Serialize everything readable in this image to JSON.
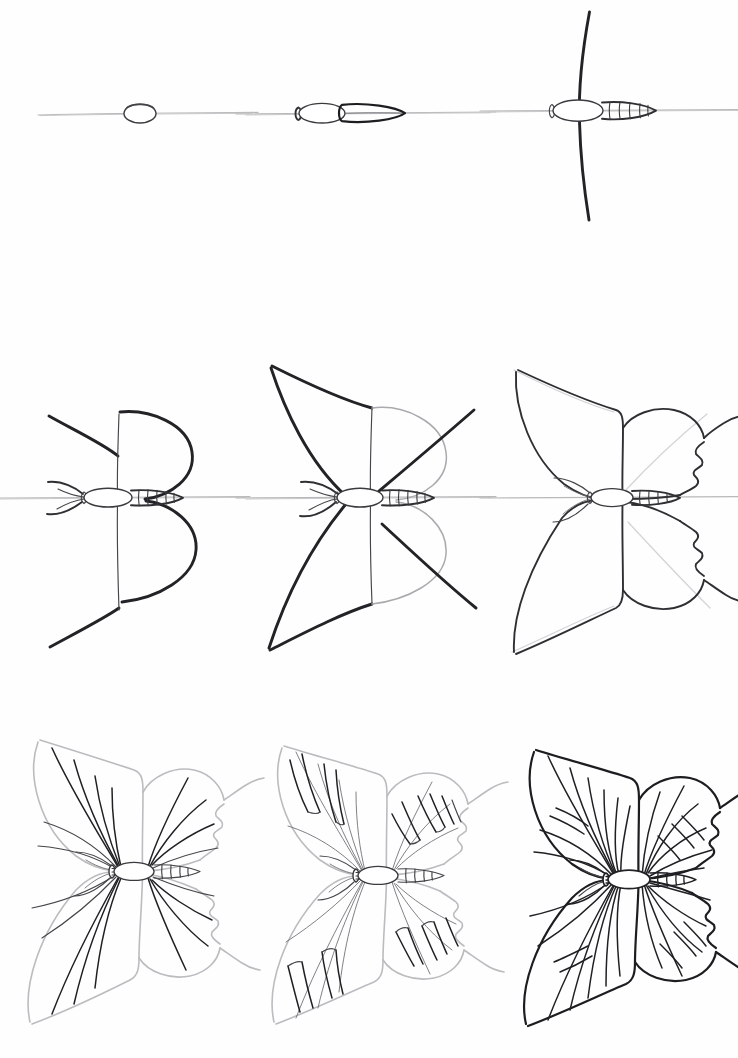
{
  "sheet": {
    "title": "How to Draw a Butterfly - 9 Step Pencil Tutorial",
    "background_color": "#ffffff",
    "width": 738,
    "height": 1058,
    "medium": "graphite pencil line drawing",
    "layout": {
      "columns": 3,
      "rows": 3,
      "total_steps": 9
    }
  },
  "palette": {
    "paper": "#ffffff",
    "guide_line": "#b9b9bb",
    "light_pencil": "#a9a9ae",
    "mid_pencil": "#45454a",
    "dark_pencil": "#2f2f33",
    "final_ink": "#1d1d21"
  },
  "steps": [
    {
      "number": 1,
      "name": "horizontal-guide-and-thorax-oval",
      "description": "A light horizontal guide line with a small rounded oval drawn on it for the thorax.",
      "elements": [
        "horizontal guide line",
        "thorax oval"
      ]
    },
    {
      "number": 2,
      "name": "head-thorax-abdomen",
      "description": "Add the small head circle at the left of the oval and an elongated pointed abdomen to the right.",
      "elements": [
        "head circle",
        "thorax oval",
        "abdomen teardrop"
      ]
    },
    {
      "number": 3,
      "name": "vertical-axis-and-segments",
      "description": "Draw a tall slightly curved vertical axis line through the thorax and divide the abdomen into segments.",
      "elements": [
        "vertical axis line",
        "segmented abdomen"
      ]
    },
    {
      "number": 4,
      "name": "right-wing-loops-antennae",
      "description": "Sketch the right fore and hind wings as two large rounded loops forming a B shape, add antennae and legs, plus two guide arcs on the left.",
      "elements": [
        "upper right wing loop",
        "lower right wing loop",
        "antennae",
        "legs",
        "upper-left guide arc",
        "lower-left guide arc"
      ]
    },
    {
      "number": 5,
      "name": "left-wing-sails-diagonals",
      "description": "Complete the left fore and hind wings as big swept sail shapes and draw diagonal guide lines across the right wings.",
      "elements": [
        "left forewing sail",
        "left hindwing sail",
        "upper diagonal guide",
        "lower diagonal guide"
      ]
    },
    {
      "number": 6,
      "name": "refined-outline-scalloped-edges",
      "description": "Firm up the full wing outline with scalloped wavy outer edges and add the pointed tail on each hind wing.",
      "elements": [
        "refined wing outline",
        "scalloped edges",
        "tails"
      ]
    },
    {
      "number": 7,
      "name": "wing-veins",
      "description": "Draw the main veins radiating from the body out to the wing edges on all four wings.",
      "elements": [
        "radiating veins",
        "vein tips"
      ]
    },
    {
      "number": 8,
      "name": "pattern-cells",
      "description": "Add the banded pattern cells along the outer margin of each wing between the veins.",
      "elements": [
        "marginal pattern bands",
        "cell outlines"
      ]
    },
    {
      "number": 9,
      "name": "final-darkened-drawing",
      "description": "Darken all lines, finish the shading and complete the butterfly with full vein detail.",
      "elements": [
        "darkened outline",
        "full vein set",
        "finished body",
        "antennae"
      ]
    }
  ]
}
